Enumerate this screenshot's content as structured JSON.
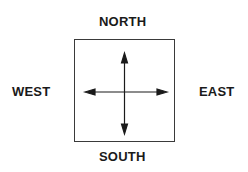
{
  "diagram": {
    "type": "compass",
    "labels": {
      "north": "NORTH",
      "south": "SOUTH",
      "west": "WEST",
      "east": "EAST"
    },
    "colors": {
      "text": "#1a1a1a",
      "stroke": "#1a1a1a",
      "background": "#ffffff"
    }
  }
}
